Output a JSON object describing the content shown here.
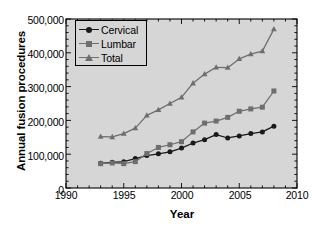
{
  "chart_data": {
    "type": "line",
    "title": "",
    "xlabel": "Year",
    "ylabel": "Annual fusion procedures",
    "xlim": [
      1990,
      2010
    ],
    "ylim": [
      0,
      500000
    ],
    "xticks": [
      "1990",
      "1995",
      "2000",
      "2005",
      "2010"
    ],
    "xtick_values": [
      1990,
      1995,
      2000,
      2005,
      2010
    ],
    "yticks": [
      "0",
      "100,000",
      "200,000",
      "300,000",
      "400,000",
      "500,000"
    ],
    "ytick_values": [
      0,
      100000,
      200000,
      300000,
      400000,
      500000
    ],
    "xminor_step": 1,
    "yminor_step": 20000,
    "grid": false,
    "legend_position": "upper left",
    "plot_background": "#d6d6d6",
    "frame_color": "#000000",
    "x": [
      1993,
      1994,
      1995,
      1996,
      1997,
      1998,
      1999,
      2000,
      2001,
      2002,
      2003,
      2004,
      2005,
      2006,
      2007,
      2008
    ],
    "series": [
      {
        "name": "Cervical",
        "marker": "circle",
        "color": "#1a1a1a",
        "line_color": "#1a1a1a",
        "values": [
          73000,
          76000,
          78000,
          87000,
          96000,
          101000,
          107000,
          118000,
          133000,
          143000,
          158000,
          148000,
          154000,
          161000,
          166000,
          183000
        ]
      },
      {
        "name": "Lumbar",
        "marker": "square",
        "color": "#6e6e6e",
        "line_color": "#6e6e6e",
        "values": [
          72000,
          74000,
          72000,
          78000,
          102000,
          120000,
          128000,
          137000,
          166000,
          192000,
          198000,
          209000,
          227000,
          234000,
          239000,
          287000
        ]
      },
      {
        "name": "Total",
        "marker": "triangle",
        "color": "#6e6e6e",
        "line_color": "#6e6e6e",
        "values": [
          152000,
          151000,
          161000,
          177000,
          215000,
          231000,
          250000,
          268000,
          310000,
          337000,
          357000,
          356000,
          382000,
          396000,
          405000,
          470000
        ]
      }
    ]
  }
}
